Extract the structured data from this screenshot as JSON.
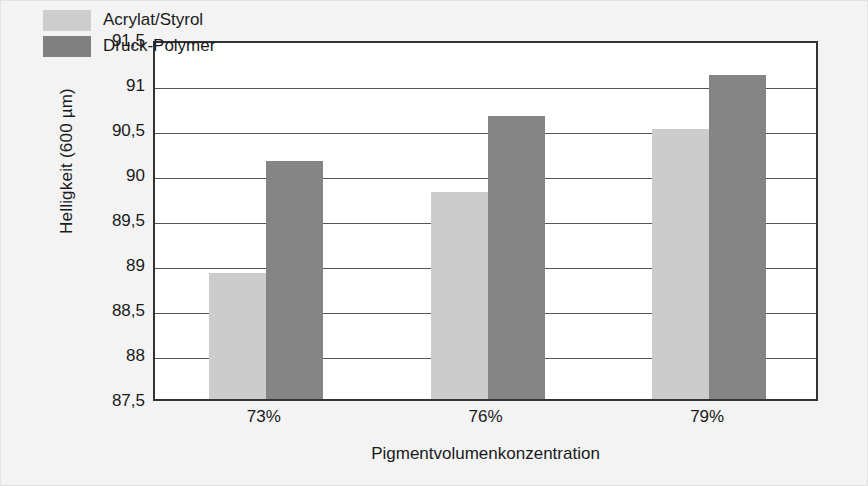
{
  "chart_data": {
    "type": "bar",
    "title": "",
    "xlabel": "Pigmentvolumenkonzentration",
    "ylabel": "Helligkeit (600 µm)",
    "categories": [
      "73%",
      "76%",
      "79%"
    ],
    "series": [
      {
        "name": "Acrylat/Styrol",
        "color": "#cccccc",
        "values": [
          88.9,
          89.8,
          90.5
        ]
      },
      {
        "name": "Druck-Polymer",
        "color": "#858585",
        "values": [
          90.15,
          90.65,
          91.1
        ]
      }
    ],
    "ylim": [
      87.5,
      91.5
    ],
    "ytick_labels": [
      "91,5",
      "91",
      "90,5",
      "90",
      "89,5",
      "89",
      "88,5",
      "88",
      "87,5"
    ],
    "ytick_values": [
      91.5,
      91,
      90.5,
      90,
      89.5,
      89,
      88.5,
      88,
      87.5
    ],
    "grid": true,
    "legend_position": "top-left-inside"
  }
}
